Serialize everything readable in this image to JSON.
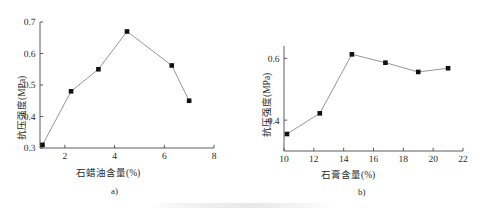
{
  "figure": {
    "background_color": "#ffffff",
    "marker_color": "#111111",
    "line_color": "#8a8a8a",
    "axis_color": "#4a4a4a"
  },
  "panels": [
    {
      "id": "a",
      "caption": "a)",
      "chart_data": {
        "type": "line",
        "title": "",
        "xlabel": "石蜡油含量(%)",
        "ylabel": "抗压强度(MPa)",
        "xlim": [
          1,
          8
        ],
        "ylim": [
          0.3,
          0.7
        ],
        "xticks": [
          2,
          4,
          6,
          8
        ],
        "xtick_labels": [
          "2",
          "4",
          "6",
          "8"
        ],
        "yticks": [
          0.3,
          0.4,
          0.5,
          0.6,
          0.7
        ],
        "ytick_labels": [
          "0.3",
          "0.4",
          "0.5",
          "0.6",
          "0.7"
        ],
        "grid": false,
        "legend": "none",
        "marker": "square",
        "x": [
          1.1,
          2.25,
          3.35,
          4.5,
          6.3,
          7.0
        ],
        "values": [
          0.31,
          0.48,
          0.55,
          0.67,
          0.562,
          0.45
        ]
      }
    },
    {
      "id": "b",
      "caption": "b)",
      "chart_data": {
        "type": "line",
        "title": "",
        "xlabel": "石膏含量(%)",
        "ylabel": "抗压强度(MPa)",
        "xlim": [
          10,
          22
        ],
        "ylim": [
          0.3,
          0.64
        ],
        "xticks": [
          10,
          12,
          14,
          16,
          18,
          20,
          22
        ],
        "xtick_labels": [
          "10",
          "12",
          "14",
          "16",
          "18",
          "20",
          "22"
        ],
        "yticks": [
          0.4,
          0.6
        ],
        "ytick_labels": [
          "0.4",
          "0.6"
        ],
        "grid": false,
        "legend": "none",
        "marker": "square",
        "x": [
          10.2,
          12.4,
          14.55,
          16.8,
          19.0,
          21.0
        ],
        "values": [
          0.355,
          0.422,
          0.613,
          0.586,
          0.556,
          0.568
        ]
      }
    }
  ],
  "chart_data": [
    {
      "type": "line",
      "panel": "a)",
      "xlabel": "石蜡油含量(%)",
      "ylabel": "抗压强度(MPa)",
      "xlim": [
        1,
        8
      ],
      "ylim": [
        0.3,
        0.7
      ],
      "xticks": [
        2,
        4,
        6,
        8
      ],
      "yticks": [
        0.3,
        0.4,
        0.5,
        0.6,
        0.7
      ],
      "x": [
        1.1,
        2.25,
        3.35,
        4.5,
        6.3,
        7.0
      ],
      "values": [
        0.31,
        0.48,
        0.55,
        0.67,
        0.562,
        0.45
      ],
      "grid": false,
      "legend": "none"
    },
    {
      "type": "line",
      "panel": "b)",
      "xlabel": "石膏含量(%)",
      "ylabel": "抗压强度(MPa)",
      "xlim": [
        10,
        22
      ],
      "ylim": [
        0.3,
        0.64
      ],
      "xticks": [
        10,
        12,
        14,
        16,
        18,
        20,
        22
      ],
      "yticks": [
        0.4,
        0.6
      ],
      "x": [
        10.2,
        12.4,
        14.55,
        16.8,
        19.0,
        21.0
      ],
      "values": [
        0.355,
        0.422,
        0.613,
        0.586,
        0.556,
        0.568
      ],
      "grid": false,
      "legend": "none"
    }
  ]
}
